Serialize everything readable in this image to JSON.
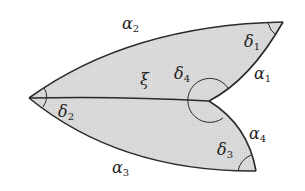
{
  "diagram": {
    "type": "geometric-figure",
    "fill_color": "#d9d9d9",
    "stroke_color": "#2a2a2a",
    "vertices": {
      "left": [
        29,
        98
      ],
      "top_right": [
        283,
        22
      ],
      "inner": [
        209,
        101
      ],
      "bottom_right": [
        256,
        171
      ]
    },
    "edges": [
      {
        "name": "alpha2",
        "label": "α",
        "sub": "2"
      },
      {
        "name": "alpha1",
        "label": "α",
        "sub": "1"
      },
      {
        "name": "xi",
        "label": "ξ",
        "sub": ""
      },
      {
        "name": "alpha4",
        "label": "α",
        "sub": "4"
      },
      {
        "name": "alpha3",
        "label": "α",
        "sub": "3"
      }
    ],
    "angles": [
      {
        "name": "delta1",
        "label": "δ",
        "sub": "1"
      },
      {
        "name": "delta2",
        "label": "δ",
        "sub": "2"
      },
      {
        "name": "delta3",
        "label": "δ",
        "sub": "3"
      },
      {
        "name": "delta4",
        "label": "δ",
        "sub": "4"
      }
    ]
  }
}
